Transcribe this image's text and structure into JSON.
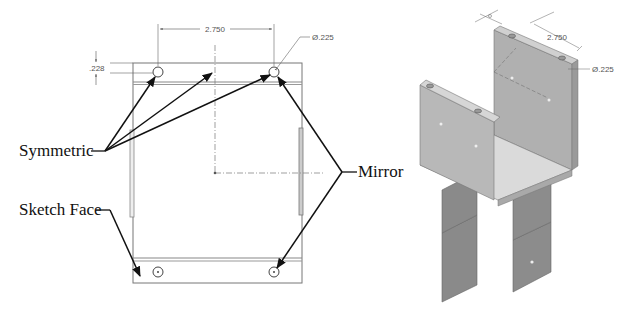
{
  "drawing": {
    "callouts": {
      "symmetric": "Symmetric",
      "sketch_face": "Sketch Face",
      "mirror": "Mirror"
    },
    "dimensions": {
      "hole_spacing": "2.750",
      "hole_diameter": "Ø.225",
      "edge_offset": ".228"
    },
    "iso_dimensions": {
      "hole_spacing": "2.750",
      "hole_diameter": "Ø.225"
    },
    "colors": {
      "line": "#111111",
      "dim_line": "#555555",
      "part_face_dark": "#8a8a8a",
      "part_face_mid": "#b5b5b5",
      "part_face_light": "#d6d6d6"
    }
  }
}
